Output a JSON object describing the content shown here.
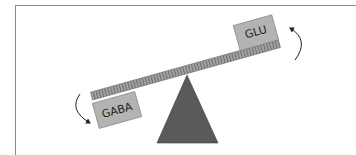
{
  "diagram": {
    "type": "seesaw-balance",
    "left_weight": {
      "label": "GABA",
      "state": "down"
    },
    "right_weight": {
      "label": "GLU",
      "state": "up"
    },
    "arrows": [
      {
        "name": "left-arrow",
        "direction": "down"
      },
      {
        "name": "right-arrow",
        "direction": "up"
      }
    ]
  },
  "colors": {
    "frame": "#8a8a8a",
    "beam": "#a8a8a8",
    "beam_ticks": "#6e6e6e",
    "weight_box": "#b3b3b3",
    "weight_border": "#7a7a7a",
    "fulcrum": "#5a5a5a",
    "arrow": "#222222"
  }
}
